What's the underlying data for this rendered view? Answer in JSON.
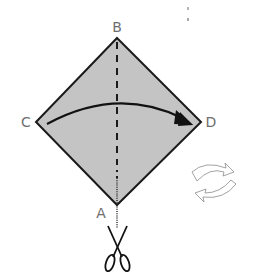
{
  "diagram": {
    "type": "paper-folding-instruction",
    "shape": "square rotated 45° (diamond)",
    "fill_color": "#c4c4c4",
    "stroke_color": "#1a1a1a",
    "label_color": "#6e6e6e",
    "vertices": {
      "B": {
        "label": "B",
        "x": 117,
        "y": 38
      },
      "C": {
        "label": "C",
        "x": 36,
        "y": 122
      },
      "D": {
        "label": "D",
        "x": 201,
        "y": 122
      },
      "A": {
        "label": "A",
        "x": 117,
        "y": 205
      }
    },
    "labels": {
      "B": "B",
      "C": "C",
      "D": "D",
      "A": "A"
    },
    "fold_line": {
      "style": "dashed",
      "from": "B",
      "to": "center"
    },
    "cut_line": {
      "style": "dotted",
      "from": "center",
      "to": "A",
      "extends_below_A": true
    },
    "fold_arrow": {
      "from": "C",
      "to": "D",
      "style": "curved arrow"
    },
    "icons": {
      "scissors": "scissors-icon",
      "rotate": "rotate-arrows-icon"
    }
  }
}
